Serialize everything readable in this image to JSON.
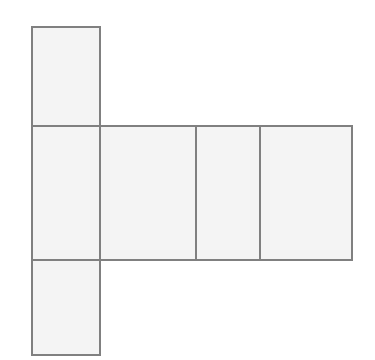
{
  "figure": {
    "type": "geometric-net",
    "canvas": {
      "width": 375,
      "height": 360,
      "background": "#ffffff"
    },
    "style": {
      "face_fill": "#f4f4f4",
      "stroke": "#808080",
      "stroke_width": 1.6
    },
    "faces": [
      {
        "id": "top-flap",
        "label": "",
        "x": 32,
        "y": 27,
        "width": 68,
        "height": 99
      },
      {
        "id": "left-panel",
        "label": "",
        "x": 32,
        "y": 126,
        "width": 68,
        "height": 134
      },
      {
        "id": "front-panel",
        "label": "",
        "x": 100,
        "y": 126,
        "width": 96,
        "height": 134
      },
      {
        "id": "right-panel",
        "label": "",
        "x": 196,
        "y": 126,
        "width": 64,
        "height": 134
      },
      {
        "id": "back-panel",
        "label": "",
        "x": 260,
        "y": 126,
        "width": 92,
        "height": 134
      },
      {
        "id": "bottom-flap",
        "label": "",
        "x": 32,
        "y": 260,
        "width": 68,
        "height": 95
      }
    ]
  }
}
